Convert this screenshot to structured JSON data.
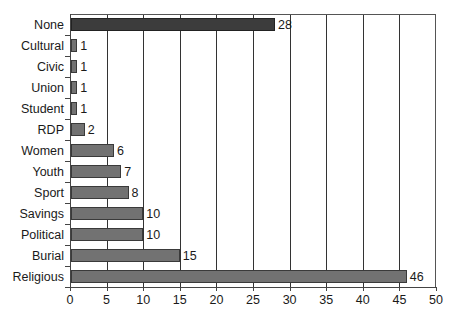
{
  "chart_data": {
    "type": "bar",
    "orientation": "horizontal",
    "title": "",
    "xlabel": "",
    "ylabel": "",
    "xlim": [
      0,
      50
    ],
    "x_ticks": [
      0,
      5,
      10,
      15,
      20,
      25,
      30,
      35,
      40,
      45,
      50
    ],
    "grid": "vertical",
    "legend": null,
    "categories": [
      "None",
      "Cultural",
      "Civic",
      "Union",
      "Student",
      "RDP",
      "Women",
      "Youth",
      "Sport",
      "Savings",
      "Political",
      "Burial",
      "Religious"
    ],
    "values": [
      28,
      1,
      1,
      1,
      1,
      2,
      6,
      7,
      8,
      10,
      10,
      15,
      46
    ],
    "data_labels": [
      "28",
      "1",
      "1",
      "1",
      "1",
      "2",
      "6",
      "7",
      "8",
      "10",
      "10",
      "15",
      "46"
    ],
    "highlighted_category": "None",
    "colors": {
      "default_bar": "#727272",
      "highlight_bar": "#3c3c3c",
      "gridline": "#333333"
    }
  }
}
